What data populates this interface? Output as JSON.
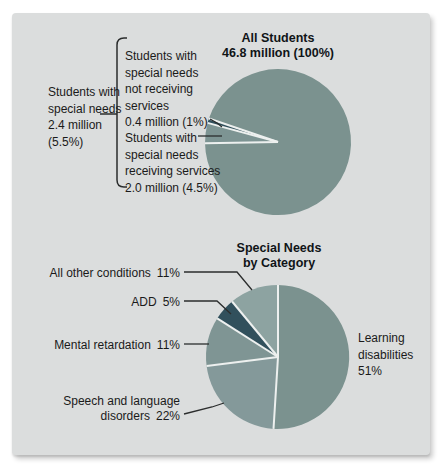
{
  "figure": {
    "card_bg": "#dbdddd",
    "text_color": "#1a1a1a",
    "divider_color": "#edf0ef",
    "line_color": "#2b2d2d"
  },
  "chart_data": [
    {
      "type": "pie",
      "title": "All Students",
      "subtitle": "46.8 million (100%)",
      "start_angle": 269,
      "total": 100,
      "slices": [
        {
          "name": "special-needs-receiving-services",
          "label": "Students with special needs receiving services",
          "amount": "2.0 million",
          "pct": "4.5%",
          "value": 4.5,
          "color": "#7d9493"
        },
        {
          "name": "special-needs-not-receiving-services",
          "label": "Students with special needs not receiving services",
          "amount": "0.4 million",
          "pct": "1%",
          "value": 1,
          "color": "#31505c"
        },
        {
          "name": "all-other-students",
          "label": "All students",
          "amount": "46.8 million",
          "pct": "100%",
          "value": 94.5,
          "color": "#7b928f"
        }
      ],
      "group_label": {
        "lines": [
          "Students with",
          "special needs",
          "2.4 million",
          "(5.5%)"
        ]
      },
      "callout_not_receiving": {
        "lines": [
          "Students with",
          "special needs",
          "not receiving",
          "services",
          "0.4 million (1%)"
        ]
      },
      "callout_receiving": {
        "lines": [
          "Students with",
          "special needs",
          "receiving services",
          "2.0 million (4.5%)"
        ]
      }
    },
    {
      "type": "pie",
      "title": "Special Needs",
      "subtitle": "by Category",
      "start_angle": 0,
      "total": 100,
      "slices": [
        {
          "name": "learning-disabilities",
          "value": 51,
          "pct": "51%",
          "color": "#7b928f",
          "label_lines": [
            "Learning",
            "disabilities"
          ]
        },
        {
          "name": "speech-and-language-disorders",
          "value": 22,
          "pct": "22%",
          "color": "#84999a",
          "label_lines": [
            "Speech and language",
            "disorders"
          ]
        },
        {
          "name": "mental-retardation",
          "value": 11,
          "pct": "11%",
          "color": "#7f9594",
          "label_lines": [
            "Mental retardation"
          ]
        },
        {
          "name": "add",
          "value": 5,
          "pct": "5%",
          "color": "#31505c",
          "label_lines": [
            "ADD"
          ]
        },
        {
          "name": "all-other-conditions",
          "value": 11,
          "pct": "11%",
          "color": "#8da3a1",
          "label_lines": [
            "All other conditions"
          ]
        }
      ]
    }
  ]
}
